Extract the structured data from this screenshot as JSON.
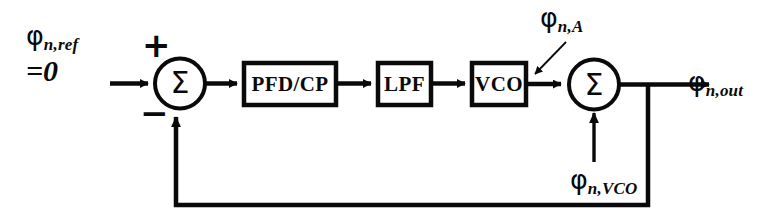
{
  "diagram": {
    "background_color": "#ffffff",
    "line_color": "#0a0a0a",
    "signals": {
      "input_label_main": "φ",
      "input_label_sub": "n,ref",
      "input_value": "=0",
      "adder_noise_main": "φ",
      "adder_noise_sub": "n,A",
      "vco_noise_main": "φ",
      "vco_noise_sub": "n,VCO",
      "output_main": "φ",
      "output_sub": "n,out"
    },
    "junctions": {
      "left_sum_symbol": "Σ",
      "right_sum_symbol": "Σ",
      "plus_sign": "+",
      "minus_sign": "−"
    },
    "blocks": [
      {
        "id": "pfd-cp",
        "label": "PFD/CP"
      },
      {
        "id": "lpf",
        "label": "LPF"
      },
      {
        "id": "vco",
        "label": "VCO"
      }
    ]
  }
}
